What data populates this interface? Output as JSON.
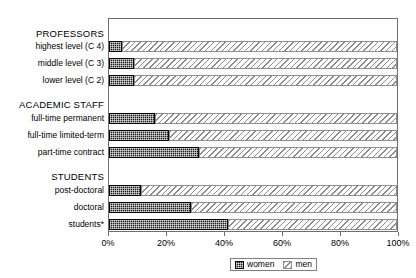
{
  "chart_data": {
    "type": "bar",
    "orientation": "horizontal",
    "stacked": true,
    "normalized_percent": true,
    "title": "",
    "xlabel": "",
    "ylabel": "",
    "xlim": [
      0,
      100
    ],
    "grid": false,
    "legend_position": "bottom",
    "xticks": [
      "0%",
      "20%",
      "40%",
      "60%",
      "80%",
      "100%"
    ],
    "xtick_values": [
      0,
      20,
      40,
      60,
      80,
      100
    ],
    "series": [
      {
        "name": "women",
        "values": [
          4.5,
          8.6,
          8.6,
          16,
          21,
          31.4,
          11,
          28.6,
          41.4
        ]
      },
      {
        "name": "men",
        "values": [
          95.5,
          91.4,
          91.4,
          84,
          79,
          68.6,
          89,
          71.4,
          58.6
        ]
      }
    ],
    "categories": [
      "highest level (C 4)",
      "middle level (C 3)",
      "lower level (C 2)",
      "full-time permanent",
      "full-time limited-term",
      "part-time contract",
      "post-doctoral",
      "doctoral",
      "students*"
    ],
    "group_headers": [
      "PROFESSORS",
      "ACADEMIC STAFF",
      "STUDENTS"
    ]
  },
  "groups": [
    {
      "header": "PROFESSORS",
      "header_top": 28,
      "rows": [
        {
          "label": "highest level (C 4)",
          "label_top": 41,
          "bar_top": 40,
          "women": 4.5,
          "men": 95.5
        },
        {
          "label": "middle level (C 3)",
          "label_top": 58,
          "bar_top": 57,
          "women": 8.6,
          "men": 91.4
        },
        {
          "label": "lower level (C 2)",
          "label_top": 75,
          "bar_top": 74,
          "women": 8.6,
          "men": 91.4
        }
      ]
    },
    {
      "header": "ACADEMIC STAFF",
      "header_top": 99,
      "rows": [
        {
          "label": "full-time permanent",
          "label_top": 113,
          "bar_top": 112,
          "women": 16,
          "men": 84
        },
        {
          "label": "full-time limited-term",
          "label_top": 130,
          "bar_top": 129,
          "women": 21,
          "men": 79
        },
        {
          "label": "part-time contract",
          "label_top": 147,
          "bar_top": 146,
          "women": 31.4,
          "men": 68.6
        }
      ]
    },
    {
      "header": "STUDENTS",
      "header_top": 171,
      "rows": [
        {
          "label": "post-doctoral",
          "label_top": 185,
          "bar_top": 184,
          "women": 11,
          "men": 89
        },
        {
          "label": "doctoral",
          "label_top": 202,
          "bar_top": 201,
          "women": 28.6,
          "men": 71.4
        },
        {
          "label": "students*",
          "label_top": 219,
          "bar_top": 218,
          "women": 41.4,
          "men": 58.6
        }
      ]
    }
  ],
  "axis": {
    "ticks": [
      {
        "label": "0%",
        "value": 0
      },
      {
        "label": "20%",
        "value": 20
      },
      {
        "label": "40%",
        "value": 40
      },
      {
        "label": "60%",
        "value": 60
      },
      {
        "label": "80%",
        "value": 80
      },
      {
        "label": "100%",
        "value": 100
      }
    ]
  },
  "legend": {
    "items": [
      {
        "label": "women",
        "swatch": "women-pattern-swatch"
      },
      {
        "label": "men",
        "swatch": "men-pattern-swatch"
      }
    ]
  },
  "colors": {
    "women_fill": "#1b1b1b",
    "men_fill": "#ffffff",
    "men_hatch": "#8a8a8a",
    "frame": "#6e6e6e",
    "text": "#000000",
    "background": "#ffffff"
  },
  "plot_geometry": {
    "left": 108,
    "top": 18,
    "width": 290,
    "height": 214
  }
}
